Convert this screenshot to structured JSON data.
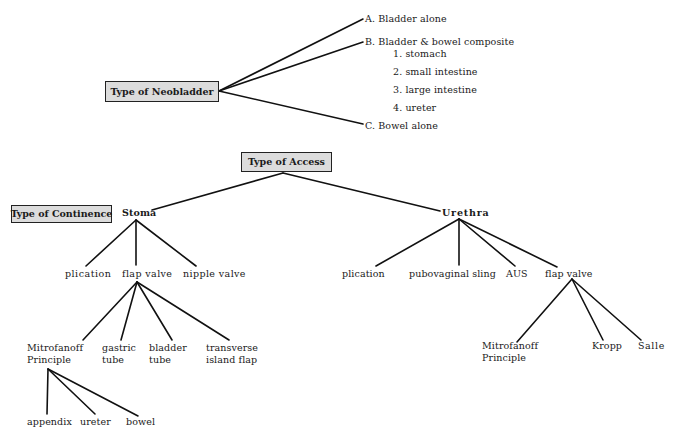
{
  "neobladder": {
    "title": "Type of Neobladder",
    "options": {
      "a": "A. Bladder alone",
      "b": "B. Bladder & bowel composite",
      "b_sub": [
        "1. stomach",
        "2. small intestine",
        "3. large intestine",
        "4. ureter"
      ],
      "c": "C. Bowel alone"
    }
  },
  "access": {
    "title": "Type of Access",
    "continence_title": "Type of Continence",
    "stoma": {
      "label": "Stoma",
      "children": {
        "plication": "plication",
        "flap_valve": "flap  valve",
        "nipple_valve": "nipple  valve"
      },
      "flap_valve_children": {
        "mitrofanoff_1": "Mitrofanoff",
        "mitrofanoff_2": "Principle",
        "gastric_1": "gastric",
        "gastric_2": "tube",
        "bladder_1": "bladder",
        "bladder_2": "tube",
        "transverse_1": "transverse",
        "transverse_2": "island  flap"
      },
      "mitrofanoff_children": {
        "appendix": "appendix",
        "ureter": "ureter",
        "bowel": "bowel"
      }
    },
    "urethra": {
      "label": "Urethra",
      "children": {
        "plication": "plication",
        "pubovaginal_sling": "pubovaginal sling",
        "aus": "AUS",
        "flap_valve": "flap  valve"
      },
      "flap_valve_children": {
        "mitrofanoff_1": "Mitrofanoff",
        "mitrofanoff_2": "Principle",
        "kropp": "Kropp",
        "salle": "Salle"
      }
    }
  },
  "colors": {
    "box_fill": "#dcdcdc",
    "line": "#111111",
    "text": "#1a1a1a"
  }
}
